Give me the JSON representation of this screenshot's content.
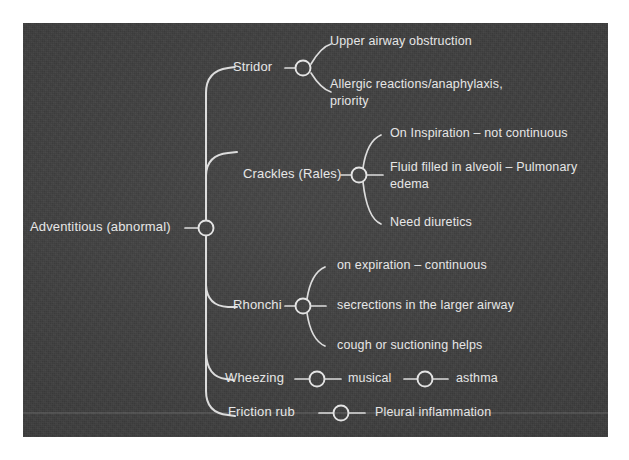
{
  "canvas": {
    "width": 629,
    "height": 460,
    "page_background": "#ffffff",
    "panel_background": "#3d3d3d",
    "text_color": "#e6e6e6",
    "line_color": "#dcdcdc"
  },
  "diagram": {
    "type": "mind-map",
    "title": "Adventitious (abnormal)",
    "root": {
      "label": "Adventitious (abnormal)",
      "x": 30,
      "y": 228
    },
    "branches": [
      {
        "label": "Stridor",
        "x": 233,
        "y": 68,
        "hub_x": 299,
        "children": [
          {
            "lines": [
              "Upper airway obstruction"
            ],
            "x": 330,
            "y": 42
          },
          {
            "lines": [
              "Allergic reactions/anaphylaxis,",
              "priority"
            ],
            "x": 330,
            "y": 85
          }
        ]
      },
      {
        "label": "Crackles  (Rales)",
        "x": 243,
        "y": 175,
        "hub_x": 359,
        "children": [
          {
            "lines": [
              "On Inspiration – not continuous"
            ],
            "x": 390,
            "y": 134
          },
          {
            "lines": [
              "Fluid filled in alveoli – Pulmonary",
              "edema"
            ],
            "x": 390,
            "y": 175
          },
          {
            "lines": [
              "Need diuretics"
            ],
            "x": 390,
            "y": 223
          }
        ]
      },
      {
        "label": "Rhonchi",
        "x": 233,
        "y": 306,
        "hub_x": 303,
        "children": [
          {
            "lines": [
              "on expiration – continuous"
            ],
            "x": 337,
            "y": 266
          },
          {
            "lines": [
              "secrections in the larger airway"
            ],
            "x": 337,
            "y": 306
          },
          {
            "lines": [
              "cough or suctioning helps"
            ],
            "x": 337,
            "y": 346
          }
        ]
      },
      {
        "label": "Wheezing",
        "x": 225,
        "y": 379,
        "chain": [
          {
            "label": "musical",
            "hub_x": 324,
            "text_x": 348
          },
          {
            "label": "asthma",
            "hub_x": 432,
            "text_x": 456
          }
        ]
      },
      {
        "label": "Friction rub",
        "x": 228,
        "y": 413,
        "chain": [
          {
            "label": "Pleural inflammation",
            "hub_x": 350,
            "text_x": 376
          }
        ]
      }
    ]
  }
}
